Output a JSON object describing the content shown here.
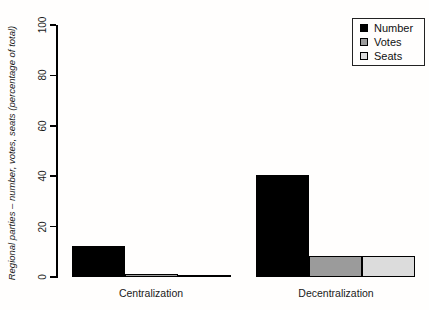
{
  "chart_data": {
    "type": "bar",
    "title": "",
    "categories": [
      "Centralization",
      "Decentralization"
    ],
    "series": [
      {
        "name": "Number",
        "color": "#000000",
        "values": [
          12.5,
          40.5
        ]
      },
      {
        "name": "Votes",
        "color": "#9b9b9b",
        "values": [
          1.0,
          8.5
        ]
      },
      {
        "name": "Seats",
        "color": "#dcdcdc",
        "values": [
          0.8,
          8.5
        ]
      }
    ],
    "xlabel": "",
    "ylabel": "Regional parties – number, votes, seats (percentage of total)",
    "ylim": [
      0,
      100
    ],
    "yticks": [
      0,
      20,
      40,
      60,
      80,
      100
    ],
    "grid": false,
    "legend": {
      "position": "top-right",
      "entries": [
        "Number",
        "Votes",
        "Seats"
      ]
    },
    "axis_color": "#000000",
    "bar_border_color": "#000000",
    "background_color": "#fffefd"
  }
}
